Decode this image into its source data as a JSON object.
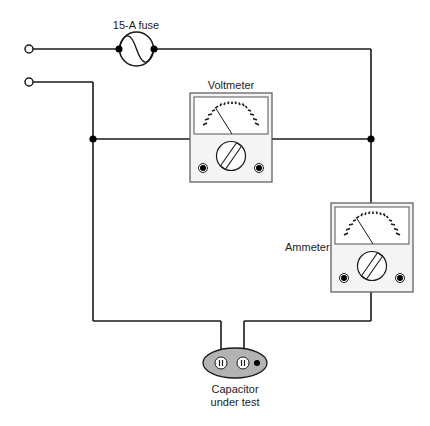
{
  "diagram": {
    "type": "circuit",
    "labels": {
      "fuse": "15-A fuse",
      "voltmeter": "Voltmeter",
      "ammeter": "Ammeter",
      "capacitor_line1": "Capacitor",
      "capacitor_line2": "under test"
    },
    "components": [
      {
        "id": "terminal-top",
        "kind": "terminal"
      },
      {
        "id": "terminal-bottom",
        "kind": "terminal"
      },
      {
        "id": "fuse",
        "kind": "fuse",
        "rating": "15-A"
      },
      {
        "id": "voltmeter",
        "kind": "meter"
      },
      {
        "id": "ammeter",
        "kind": "meter"
      },
      {
        "id": "capacitor",
        "kind": "capacitor-plug"
      }
    ],
    "colors": {
      "wire": "#1a1a1a",
      "meter_face": "#ffffff",
      "meter_body": "#f4f4f4",
      "capacitor_fill": "#b3b3b3"
    }
  }
}
